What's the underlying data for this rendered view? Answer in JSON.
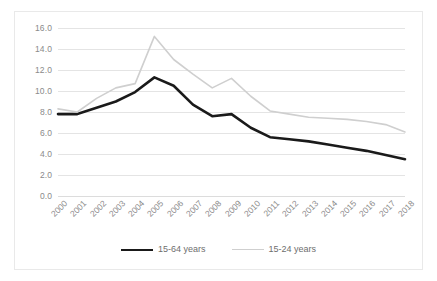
{
  "chart_data": {
    "type": "line",
    "title": "",
    "subtitle": "",
    "xlabel": "",
    "ylabel": "",
    "ylim": [
      0.0,
      16.0
    ],
    "ytick_step": 2.0,
    "ytick_labels": [
      "16.0",
      "14.0",
      "12.0",
      "10.0",
      "8.0",
      "6.0",
      "4.0",
      "2.0",
      "0.0"
    ],
    "ytick_values": [
      16.0,
      14.0,
      12.0,
      10.0,
      8.0,
      6.0,
      4.0,
      2.0,
      0.0
    ],
    "grid": true,
    "grid_axis": "y",
    "legend_position": "bottom",
    "x": [
      "2000",
      "2001",
      "2002",
      "2003",
      "2004",
      "2005",
      "2006",
      "2007",
      "2008",
      "2009",
      "2010",
      "2011",
      "2012",
      "2013",
      "2014",
      "2015",
      "2016",
      "2017",
      "2018"
    ],
    "categories": [
      "2000",
      "2001",
      "2002",
      "2003",
      "2004",
      "2005",
      "2006",
      "2007",
      "2008",
      "2009",
      "2010",
      "2011",
      "2012",
      "2013",
      "2014",
      "2015",
      "2016",
      "2017",
      "2018"
    ],
    "series": [
      {
        "name": "15-64 years",
        "color": "#1a1a1a",
        "line_width": 2.6,
        "values": [
          7.8,
          7.8,
          8.4,
          9.0,
          9.9,
          11.3,
          10.5,
          8.7,
          7.6,
          7.8,
          6.5,
          5.6,
          5.4,
          5.2,
          4.9,
          4.6,
          4.3,
          3.9,
          3.5
        ]
      },
      {
        "name": "15-24 years",
        "color": "#cfcfcf",
        "line_width": 1.6,
        "values": [
          8.3,
          8.0,
          9.3,
          10.3,
          10.7,
          15.2,
          13.0,
          11.6,
          10.3,
          11.2,
          9.5,
          8.1,
          7.8,
          7.5,
          7.4,
          7.3,
          7.1,
          6.8,
          6.1
        ]
      }
    ]
  },
  "legend": {
    "items": [
      {
        "label": "15-64 years"
      },
      {
        "label": "15-24 years"
      }
    ]
  },
  "colors": {
    "series_primary": "#1a1a1a",
    "series_secondary": "#cfcfcf",
    "gridline": "#e4e4e4",
    "tick_text": "#8a8a8a",
    "frame": "#e9e9e9",
    "background": "#ffffff"
  }
}
